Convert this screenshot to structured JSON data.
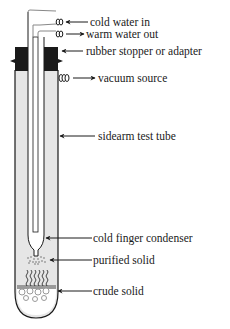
{
  "diagram": {
    "type": "labeled-apparatus",
    "labels": [
      {
        "id": "cold-water-in",
        "text": "cold water in",
        "arrow": "in"
      },
      {
        "id": "warm-water-out",
        "text": "warm water out",
        "arrow": "out"
      },
      {
        "id": "rubber-stopper",
        "text": "rubber stopper or adapter",
        "arrow": "in"
      },
      {
        "id": "vacuum-source",
        "text": "vacuum source",
        "arrow": "out"
      },
      {
        "id": "sidearm-test-tube",
        "text": "sidearm test tube",
        "arrow": "in"
      },
      {
        "id": "cold-finger",
        "text": "cold finger condenser",
        "arrow": "in"
      },
      {
        "id": "purified-solid",
        "text": "purified solid",
        "arrow": "in"
      },
      {
        "id": "crude-solid",
        "text": "crude solid",
        "arrow": "in"
      }
    ],
    "colors": {
      "line": "#1a1a1a",
      "tube_fill": "#e6e6e6",
      "stopper": "#1a1a1a",
      "inner_tube": "#ffffff",
      "crude_solid": "#9a9a9a"
    }
  }
}
